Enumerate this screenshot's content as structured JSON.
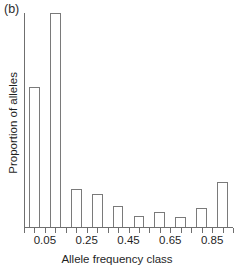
{
  "figure": {
    "panel_label": "(b)",
    "background": "#ffffff",
    "line_color": "#7a7a7a"
  },
  "chart_data": {
    "type": "bar",
    "title": "",
    "subtitle": "",
    "xlabel": "Allele frequency class",
    "ylabel": "Proportion of alleles",
    "categories": [
      "0.05",
      "0.15",
      "0.25",
      "0.35",
      "0.45",
      "0.55",
      "0.65",
      "0.75",
      "0.85",
      "0.95"
    ],
    "values": [
      0.222,
      0.34,
      0.061,
      0.053,
      0.034,
      0.018,
      0.024,
      0.016,
      0.03,
      0.072
    ],
    "xtick_labels": [
      "0.05",
      "0.25",
      "0.45",
      "0.65",
      "0.85"
    ],
    "xtick_positions": [
      0.05,
      0.25,
      0.45,
      0.65,
      0.85
    ],
    "ytick_labels": [],
    "xlim": [
      0.0,
      1.0
    ],
    "ylim": [
      0,
      0.34
    ],
    "grid": false,
    "legend": false,
    "legend_position": "none",
    "bar_fill": "#ffffff",
    "bar_edge": "#7a7a7a",
    "annotations": []
  }
}
